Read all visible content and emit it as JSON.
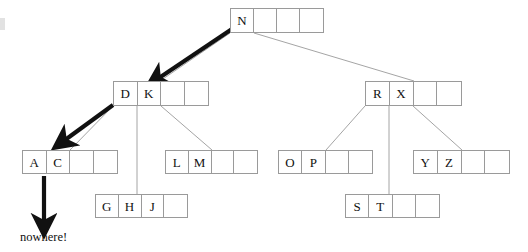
{
  "diagram": {
    "type": "b-tree",
    "background_color": "#ffffff",
    "node_border_color": "#9a9a9a",
    "edge_color": "#9a9a9a",
    "arrow_color": "#111111",
    "text_color": "#111111",
    "order": 5,
    "cells_per_node": 4
  },
  "nodes": [
    {
      "id": "root",
      "level": 0,
      "keys": [
        "N"
      ],
      "cells": [
        "N",
        "",
        "",
        ""
      ],
      "x": 230,
      "y": 8,
      "width": 94,
      "height": 25
    },
    {
      "id": "internal-left",
      "level": 1,
      "keys": [
        "D",
        "K"
      ],
      "cells": [
        "D",
        "K",
        "",
        ""
      ],
      "x": 113,
      "y": 81,
      "width": 96,
      "height": 25
    },
    {
      "id": "internal-right",
      "level": 1,
      "keys": [
        "R",
        "X"
      ],
      "cells": [
        "R",
        "X",
        "",
        ""
      ],
      "x": 365,
      "y": 81,
      "width": 97,
      "height": 25
    },
    {
      "id": "leaf-ac",
      "level": 2,
      "keys": [
        "A",
        "C"
      ],
      "cells": [
        "A",
        "C",
        "",
        ""
      ],
      "x": 22,
      "y": 150,
      "width": 96,
      "height": 24
    },
    {
      "id": "leaf-lm",
      "level": 2,
      "keys": [
        "L",
        "M"
      ],
      "cells": [
        "L",
        "M",
        "",
        ""
      ],
      "x": 165,
      "y": 150,
      "width": 93,
      "height": 24
    },
    {
      "id": "leaf-op",
      "level": 2,
      "keys": [
        "O",
        "P"
      ],
      "cells": [
        "O",
        "P",
        "",
        ""
      ],
      "x": 278,
      "y": 150,
      "width": 95,
      "height": 24
    },
    {
      "id": "leaf-yz",
      "level": 2,
      "keys": [
        "Y",
        "Z"
      ],
      "cells": [
        "Y",
        "Z",
        "",
        ""
      ],
      "x": 413,
      "y": 150,
      "width": 97,
      "height": 24
    },
    {
      "id": "leaf-ghj",
      "level": 3,
      "keys": [
        "G",
        "H",
        "J"
      ],
      "cells": [
        "G",
        "H",
        "J",
        ""
      ],
      "x": 95,
      "y": 194,
      "width": 93,
      "height": 24
    },
    {
      "id": "leaf-st",
      "level": 3,
      "keys": [
        "S",
        "T"
      ],
      "cells": [
        "S",
        "T",
        "",
        ""
      ],
      "x": 345,
      "y": 194,
      "width": 95,
      "height": 24
    }
  ],
  "edges": [
    {
      "from": "root",
      "to": "internal-left",
      "x1": 230,
      "y1": 33,
      "x2": 160,
      "y2": 81
    },
    {
      "from": "root",
      "to": "internal-right",
      "x1": 254,
      "y1": 33,
      "x2": 414,
      "y2": 81
    },
    {
      "from": "internal-left",
      "to": "leaf-ac",
      "x1": 113,
      "y1": 106,
      "x2": 70,
      "y2": 150
    },
    {
      "from": "internal-left",
      "to": "leaf-ghj",
      "x1": 137,
      "y1": 106,
      "x2": 137,
      "y2": 194
    },
    {
      "from": "internal-left",
      "to": "leaf-lm",
      "x1": 161,
      "y1": 106,
      "x2": 212,
      "y2": 150
    },
    {
      "from": "internal-right",
      "to": "leaf-op",
      "x1": 365,
      "y1": 106,
      "x2": 326,
      "y2": 150
    },
    {
      "from": "internal-right",
      "to": "leaf-st",
      "x1": 389,
      "y1": 106,
      "x2": 389,
      "y2": 194
    },
    {
      "from": "internal-right",
      "to": "leaf-yz",
      "x1": 413,
      "y1": 106,
      "x2": 462,
      "y2": 150
    }
  ],
  "arrows": [
    {
      "id": "arrow-root-to-internal-left",
      "style": "thick",
      "x1": 232,
      "y1": 29,
      "x2": 159,
      "y2": 78
    },
    {
      "id": "arrow-internal-left-to-leaf-ac",
      "style": "thick",
      "x1": 113,
      "y1": 105,
      "x2": 65,
      "y2": 140
    },
    {
      "id": "arrow-leaf-ac-to-nowhere",
      "style": "thick",
      "x1": 44,
      "y1": 176,
      "x2": 44,
      "y2": 222
    }
  ],
  "labels": {
    "nowhere": "nowhere!",
    "nowhere_x": 20,
    "nowhere_y": 230
  }
}
